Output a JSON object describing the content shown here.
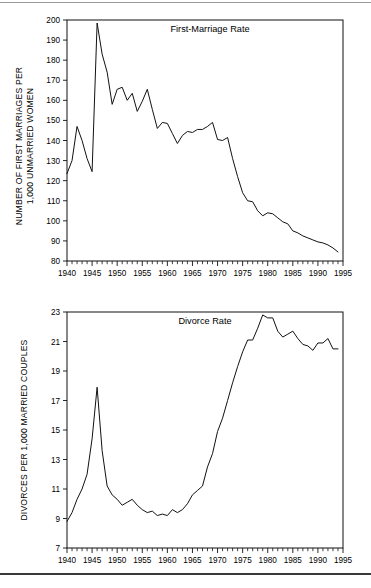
{
  "page": {
    "background": "#ffffff",
    "line_color": "#111111",
    "top_rule": true,
    "bottom_rule": true
  },
  "chart_data": [
    {
      "type": "line",
      "id": "first-marriage-rate",
      "title": "First-Marriage Rate",
      "xlabel": "",
      "ylabel": "NUMBER OF FIRST MARRIAGES PER 1,000 UNMARRIED WOMEN",
      "ylabel_line1": "NUMBER OF FIRST MARRIAGES PER",
      "ylabel_line2": "1,000 UNMARRIED WOMEN",
      "xlim": [
        1940,
        1995
      ],
      "ylim": [
        80,
        200
      ],
      "yticks": [
        80,
        90,
        100,
        110,
        120,
        130,
        140,
        150,
        160,
        170,
        180,
        190,
        200
      ],
      "xticks": [
        1940,
        1945,
        1950,
        1955,
        1960,
        1965,
        1970,
        1975,
        1980,
        1985,
        1990,
        1995
      ],
      "minor_x_step": 1,
      "grid": false,
      "legend": "none",
      "x": [
        1940,
        1941,
        1942,
        1943,
        1944,
        1945,
        1946,
        1947,
        1948,
        1949,
        1950,
        1951,
        1952,
        1953,
        1954,
        1955,
        1956,
        1957,
        1958,
        1959,
        1960,
        1961,
        1962,
        1963,
        1964,
        1965,
        1966,
        1967,
        1968,
        1969,
        1970,
        1971,
        1972,
        1973,
        1974,
        1975,
        1976,
        1977,
        1978,
        1979,
        1980,
        1981,
        1982,
        1983,
        1984,
        1985,
        1986,
        1987,
        1988,
        1989,
        1990,
        1991,
        1992,
        1993,
        1994
      ],
      "values": [
        123.5,
        130.0,
        147.0,
        140.0,
        131.0,
        124.5,
        198.5,
        183.0,
        174.0,
        158.0,
        165.5,
        166.5,
        160.0,
        163.5,
        154.5,
        159.5,
        165.5,
        155.5,
        146.0,
        149.0,
        148.5,
        143.5,
        138.5,
        142.5,
        144.5,
        144.0,
        145.5,
        145.5,
        147.0,
        149.0,
        140.5,
        140.0,
        141.5,
        131.0,
        122.0,
        114.0,
        110.0,
        109.5,
        105.0,
        102.5,
        104.0,
        103.5,
        101.5,
        99.5,
        98.5,
        95.0,
        94.0,
        92.5,
        91.5,
        90.5,
        89.5,
        89.0,
        88.0,
        86.5,
        84.5
      ]
    },
    {
      "type": "line",
      "id": "divorce-rate",
      "title": "Divorce Rate",
      "xlabel": "",
      "ylabel": "DIVORCES PER 1,000 MARRIED COUPLES",
      "xlim": [
        1940,
        1995
      ],
      "ylim": [
        7,
        23
      ],
      "yticks": [
        7,
        9,
        11,
        13,
        15,
        17,
        19,
        21,
        23
      ],
      "xticks": [
        1940,
        1945,
        1950,
        1955,
        1960,
        1965,
        1970,
        1975,
        1980,
        1985,
        1990,
        1995
      ],
      "minor_x_step": 1,
      "grid": false,
      "legend": "none",
      "x": [
        1940,
        1941,
        1942,
        1943,
        1944,
        1945,
        1946,
        1947,
        1948,
        1949,
        1950,
        1951,
        1952,
        1953,
        1954,
        1955,
        1956,
        1957,
        1958,
        1959,
        1960,
        1961,
        1962,
        1963,
        1964,
        1965,
        1966,
        1967,
        1968,
        1969,
        1970,
        1971,
        1972,
        1973,
        1974,
        1975,
        1976,
        1977,
        1978,
        1979,
        1980,
        1981,
        1982,
        1983,
        1984,
        1985,
        1986,
        1987,
        1988,
        1989,
        1990,
        1991,
        1992,
        1993,
        1994
      ],
      "values": [
        8.8,
        9.4,
        10.3,
        11.0,
        12.0,
        14.4,
        17.9,
        13.6,
        11.2,
        10.6,
        10.3,
        9.9,
        10.1,
        10.3,
        9.9,
        9.6,
        9.4,
        9.5,
        9.2,
        9.3,
        9.2,
        9.6,
        9.4,
        9.6,
        10.0,
        10.6,
        10.9,
        11.2,
        12.5,
        13.4,
        14.9,
        15.8,
        17.0,
        18.2,
        19.3,
        20.3,
        21.1,
        21.1,
        21.9,
        22.8,
        22.6,
        22.6,
        21.7,
        21.3,
        21.5,
        21.7,
        21.2,
        20.8,
        20.7,
        20.4,
        20.9,
        20.9,
        21.2,
        20.5,
        20.5
      ]
    }
  ]
}
